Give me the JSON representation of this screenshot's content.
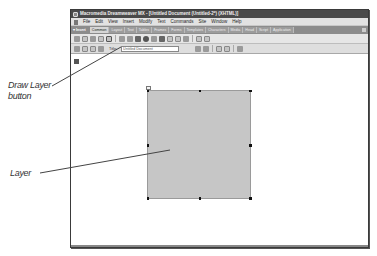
{
  "window": {
    "title": "Macromedia Dreamweaver MX - [Untitled Document (Untitled-2*) (XHTML)]"
  },
  "menubar": {
    "items": [
      "File",
      "Edit",
      "View",
      "Insert",
      "Modify",
      "Text",
      "Commands",
      "Site",
      "Window",
      "Help"
    ]
  },
  "insert_bar": {
    "panel_label": "▾ Insert",
    "tabs": [
      "Common",
      "Layout",
      "Text",
      "Tables",
      "Frames",
      "Forms",
      "Templates",
      "Characters",
      "Media",
      "Head",
      "Script",
      "Application"
    ],
    "active_tab": "Common"
  },
  "document_toolbar": {
    "title_label": "Title:",
    "title_value": "Untitled Document"
  },
  "callouts": {
    "draw_layer": "Draw Layer\nbutton",
    "draw_layer_line1": "Draw Layer",
    "draw_layer_line2": "button",
    "layer": "Layer"
  },
  "colors": {
    "titlebar": "#4a4a4a",
    "insert_tabs": "#8c8c8c",
    "layer_fill": "#c6c6c6"
  }
}
